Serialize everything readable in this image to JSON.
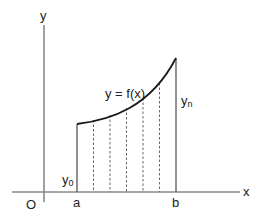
{
  "diagram": {
    "axes": {
      "x_label": "x",
      "y_label": "y",
      "origin_label": "O"
    },
    "curve_label": "y = f(x)",
    "interval": {
      "start_label": "a",
      "end_label": "b"
    },
    "ordinates": {
      "first_label_base": "y",
      "first_label_sub": "0",
      "last_label_base": "y",
      "last_label_sub": "n"
    },
    "strip_count": 6,
    "colors": {
      "axis": "#8a8a8a",
      "curve": "#1a1a1a",
      "ordinate": "#555555",
      "dashed": "#666666",
      "text": "#222222"
    }
  }
}
